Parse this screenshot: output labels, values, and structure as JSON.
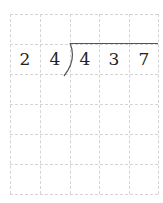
{
  "worksheet": {
    "type": "long-division-grid",
    "rows": 6,
    "columns": 5,
    "divisor": [
      "2",
      "4"
    ],
    "dividend": [
      "4",
      "3",
      "7"
    ],
    "colors": {
      "grid": "#d4d4d4",
      "text": "#222222",
      "bracket": "#555555"
    }
  }
}
